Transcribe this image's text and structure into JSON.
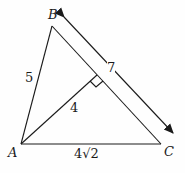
{
  "diagram": {
    "type": "triangle-with-altitude",
    "vertices": {
      "A": "A",
      "B": "B",
      "C": "C"
    },
    "labels": {
      "AB": "5",
      "altitude": "4",
      "BC_length": "7",
      "AC": "4√2"
    },
    "right_angle_marker": true,
    "colors": {
      "stroke": "#1a1a1a",
      "background": "#fefefe"
    }
  }
}
